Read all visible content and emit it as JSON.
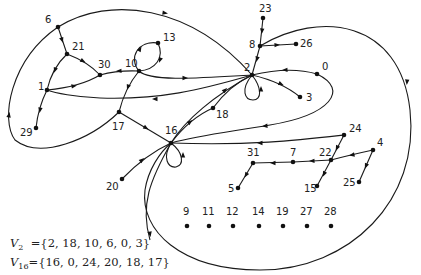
{
  "diagram": {
    "type": "directed-graph",
    "nodes": [
      {
        "id": "6",
        "x": 58,
        "y": 27,
        "lx": 45,
        "ly": 23
      },
      {
        "id": "21",
        "x": 67,
        "y": 54,
        "lx": 72,
        "ly": 50
      },
      {
        "id": "30",
        "x": 100,
        "y": 75,
        "lx": 98,
        "ly": 68
      },
      {
        "id": "10",
        "x": 139,
        "y": 71,
        "lx": 125,
        "ly": 67
      },
      {
        "id": "13",
        "x": 158,
        "y": 43,
        "lx": 163,
        "ly": 41
      },
      {
        "id": "1",
        "x": 47,
        "y": 90,
        "lx": 38,
        "ly": 90
      },
      {
        "id": "29",
        "x": 36,
        "y": 128,
        "lx": 20,
        "ly": 136
      },
      {
        "id": "17",
        "x": 119,
        "y": 112,
        "lx": 112,
        "ly": 130
      },
      {
        "id": "16",
        "x": 171,
        "y": 143,
        "lx": 165,
        "ly": 134
      },
      {
        "id": "18",
        "x": 213,
        "y": 108,
        "lx": 216,
        "ly": 118
      },
      {
        "id": "2",
        "x": 252,
        "y": 75,
        "lx": 244,
        "ly": 71
      },
      {
        "id": "8",
        "x": 260,
        "y": 46,
        "lx": 249,
        "ly": 48
      },
      {
        "id": "23",
        "x": 263,
        "y": 18,
        "lx": 259,
        "ly": 12
      },
      {
        "id": "26",
        "x": 296,
        "y": 44,
        "lx": 300,
        "ly": 47
      },
      {
        "id": "0",
        "x": 317,
        "y": 74,
        "lx": 322,
        "ly": 70
      },
      {
        "id": "3",
        "x": 300,
        "y": 97,
        "lx": 306,
        "ly": 101
      },
      {
        "id": "24",
        "x": 344,
        "y": 135,
        "lx": 349,
        "ly": 132
      },
      {
        "id": "4",
        "x": 373,
        "y": 150,
        "lx": 377,
        "ly": 146
      },
      {
        "id": "22",
        "x": 331,
        "y": 160,
        "lx": 319,
        "ly": 156
      },
      {
        "id": "7",
        "x": 293,
        "y": 162,
        "lx": 290,
        "ly": 156
      },
      {
        "id": "31",
        "x": 253,
        "y": 163,
        "lx": 247,
        "ly": 156
      },
      {
        "id": "5",
        "x": 238,
        "y": 188,
        "lx": 228,
        "ly": 192
      },
      {
        "id": "15",
        "x": 317,
        "y": 186,
        "lx": 304,
        "ly": 192
      },
      {
        "id": "25",
        "x": 359,
        "y": 182,
        "lx": 343,
        "ly": 186
      },
      {
        "id": "20",
        "x": 122,
        "y": 179,
        "lx": 106,
        "ly": 190
      },
      {
        "id": "9",
        "x": 187,
        "y": 226,
        "lx": 183,
        "ly": 215
      },
      {
        "id": "11",
        "x": 209,
        "y": 226,
        "lx": 202,
        "ly": 215
      },
      {
        "id": "12",
        "x": 233,
        "y": 226,
        "lx": 226,
        "ly": 215
      },
      {
        "id": "14",
        "x": 259,
        "y": 226,
        "lx": 252,
        "ly": 215
      },
      {
        "id": "19",
        "x": 283,
        "y": 226,
        "lx": 276,
        "ly": 215
      },
      {
        "id": "27",
        "x": 307,
        "y": 226,
        "lx": 300,
        "ly": 215
      },
      {
        "id": "28",
        "x": 331,
        "y": 226,
        "lx": 324,
        "ly": 215
      }
    ],
    "edges": [
      {
        "from": "6",
        "to": "21",
        "path": "M58,27 L67,54",
        "ax": 62,
        "ay": 40,
        "ang": 72
      },
      {
        "from": "21",
        "to": "1",
        "path": "M67,54 Q52,68 47,90",
        "ax": 55,
        "ay": 70,
        "ang": 110
      },
      {
        "from": "21",
        "to": "30",
        "path": "M67,54 Q88,62 100,75",
        "ax": 83,
        "ay": 61,
        "ang": 28
      },
      {
        "from": "10",
        "to": "30",
        "path": "M139,71 Q118,70 100,75",
        "ax": 119,
        "ay": 71,
        "ang": 178
      },
      {
        "from": "1",
        "to": "30",
        "path": "M47,90 Q80,87 100,75",
        "ax": 74,
        "ay": 86,
        "ang": -10
      },
      {
        "from": "1",
        "to": "29",
        "path": "M47,90 Q38,108 36,128",
        "ax": 40,
        "ay": 110,
        "ang": 100
      },
      {
        "from": "10",
        "to": "13",
        "path": "M139,71 C128,58 138,40 158,43",
        "ax": 140,
        "ay": 49,
        "ang": -60
      },
      {
        "from": "13",
        "to": "10",
        "path": "M158,43 C165,58 155,70 139,71",
        "ax": 160,
        "ay": 60,
        "ang": 110
      },
      {
        "from": "10",
        "to": "2",
        "path": "M139,71 C150,82 200,78 252,75",
        "ax": 185,
        "ay": 78,
        "ang": 0
      },
      {
        "from": "2",
        "to": "1",
        "path": "M252,75 C200,90 160,100 100,98 C75,97 55,93 47,90",
        "ax": 155,
        "ay": 99,
        "ang": 180
      },
      {
        "from": "10",
        "to": "17",
        "path": "M139,71 Q125,88 119,112",
        "ax": 128,
        "ay": 87,
        "ang": 110
      },
      {
        "from": "17",
        "to": "16",
        "path": "M119,112 L171,143",
        "ax": 146,
        "ay": 128,
        "ang": 31
      },
      {
        "from": "17",
        "to": "1",
        "path": "M119,112 C90,140 40,160 15,140 C0,120 10,60 58,27",
        "ax": 9,
        "ay": 115,
        "ang": -80
      },
      {
        "from": "6",
        "to": "2",
        "path": "M58,27 C110,-5 190,5 252,75",
        "ax": 165,
        "ay": 13,
        "ang": 8
      },
      {
        "from": "16",
        "to": "18",
        "path": "M171,143 Q190,118 213,108",
        "ax": 190,
        "ay": 122,
        "ang": -40
      },
      {
        "from": "18",
        "to": "2",
        "path": "M213,108 Q230,85 252,75",
        "ax": 225,
        "ay": 90,
        "ang": -45
      },
      {
        "from": "2",
        "to": "16",
        "path": "M252,75 C215,95 185,120 171,143",
        "ax": 0,
        "ay": 0,
        "ang": 0
      },
      {
        "from": "23",
        "to": "8",
        "path": "M263,18 L260,46",
        "ax": 262,
        "ay": 31,
        "ang": 95
      },
      {
        "from": "8",
        "to": "26",
        "path": "M260,46 L296,44",
        "ax": 277,
        "ay": 45,
        "ang": -3
      },
      {
        "from": "8",
        "to": "2",
        "path": "M260,46 L252,75",
        "ax": 257,
        "ay": 59,
        "ang": 105
      },
      {
        "from": "8",
        "to": "16",
        "path": "M260,46 C320,10 400,20 410,110 C420,200 350,270 260,270 C180,270 140,230 145,190 C148,170 160,152 171,143",
        "ax": 407,
        "ay": 82,
        "ang": 95
      },
      {
        "from": "2",
        "to": "3",
        "path": "M252,75 Q282,82 300,97",
        "ax": 281,
        "ay": 84,
        "ang": 25
      },
      {
        "from": "0",
        "to": "2",
        "path": "M317,74 Q290,66 252,75",
        "ax": 285,
        "ay": 70,
        "ang": 178
      },
      {
        "from": "0",
        "to": "16",
        "path": "M317,74 C350,90 330,115 270,125 C230,132 200,135 171,143",
        "ax": 265,
        "ay": 126,
        "ang": 175
      },
      {
        "from": "2",
        "to": "2",
        "path": "M252,75 C240,90 245,100 253,100 C262,100 262,88 252,75",
        "ax": 261,
        "ay": 89,
        "ang": -90
      },
      {
        "from": "16",
        "to": "16",
        "path": "M171,143 C162,158 168,168 176,167 C184,165 184,153 171,143",
        "ax": 183,
        "ay": 155,
        "ang": -90
      },
      {
        "from": "24",
        "to": "16",
        "path": "M344,135 C300,140 250,146 171,143",
        "ax": 260,
        "ay": 143,
        "ang": 180
      },
      {
        "from": "24",
        "to": "22",
        "path": "M344,135 L331,160",
        "ax": 337,
        "ay": 148,
        "ang": 115
      },
      {
        "from": "22",
        "to": "15",
        "path": "M331,160 L317,186",
        "ax": 324,
        "ay": 174,
        "ang": 115
      },
      {
        "from": "4",
        "to": "22",
        "path": "M373,150 Q350,155 331,160",
        "ax": 352,
        "ay": 155,
        "ang": 168
      },
      {
        "from": "4",
        "to": "25",
        "path": "M373,150 L359,182",
        "ax": 366,
        "ay": 166,
        "ang": 113
      },
      {
        "from": "22",
        "to": "7",
        "path": "M331,160 L293,162",
        "ax": 312,
        "ay": 161,
        "ang": 178
      },
      {
        "from": "7",
        "to": "31",
        "path": "M293,162 L253,163",
        "ax": 273,
        "ay": 163,
        "ang": 180
      },
      {
        "from": "31",
        "to": "5",
        "path": "M253,163 L238,188",
        "ax": 246,
        "ay": 175,
        "ang": 120
      },
      {
        "from": "20",
        "to": "16",
        "path": "M122,179 Q145,155 171,143",
        "ax": 142,
        "ay": 160,
        "ang": -40
      },
      {
        "from": "16",
        "to": "bottom",
        "path": "M171,143 C150,180 140,205 150,240",
        "ax": 150,
        "ay": 234,
        "ang": 80
      }
    ]
  },
  "annotations": {
    "set1_label": "V",
    "set1_sub": "2",
    "set1_value": "={2, 18, 10, 6, 0, 3}",
    "set2_label": "V",
    "set2_sub": "16",
    "set2_value": "={16, 0, 24, 20, 18, 17}"
  }
}
